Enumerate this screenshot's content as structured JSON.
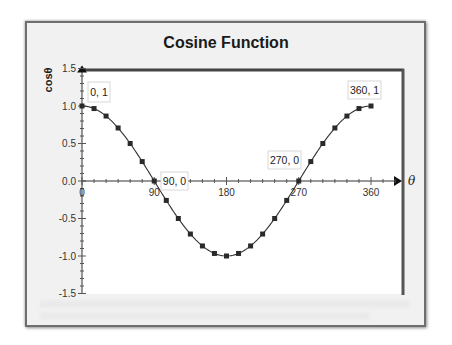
{
  "chart_data": {
    "type": "line",
    "title": "Cosine Function",
    "xlabel": "θ",
    "ylabel": "cosθ",
    "x": [
      0,
      15,
      30,
      45,
      60,
      75,
      90,
      105,
      120,
      135,
      150,
      165,
      180,
      195,
      210,
      225,
      240,
      255,
      270,
      285,
      300,
      315,
      330,
      345,
      360
    ],
    "series": [
      {
        "name": "cos θ",
        "values": [
          1.0,
          0.966,
          0.866,
          0.707,
          0.5,
          0.259,
          0.0,
          -0.259,
          -0.5,
          -0.707,
          -0.866,
          -0.966,
          -1.0,
          -0.966,
          -0.866,
          -0.707,
          -0.5,
          -0.259,
          0.0,
          0.259,
          0.5,
          0.707,
          0.866,
          0.966,
          1.0
        ],
        "marker": "square",
        "color": "#333333"
      }
    ],
    "xlim": [
      0,
      400
    ],
    "ylim": [
      -1.5,
      1.5
    ],
    "x_ticks": [
      "0",
      "90",
      "180",
      "270",
      "360"
    ],
    "y_ticks": [
      "1.5",
      "1.0",
      "0.5",
      "0.0",
      "-0.5",
      "-1.0",
      "-1.5"
    ],
    "annotations": [
      {
        "text": "0, 1",
        "x": 0,
        "y": 1
      },
      {
        "text": "90, 0",
        "x": 90,
        "y": 0
      },
      {
        "text": "270, 0",
        "x": 270,
        "y": 0
      },
      {
        "text": "360, 1",
        "x": 360,
        "y": 1
      }
    ],
    "grid": false,
    "legend": "none"
  },
  "chart": {
    "title": "Cosine Function",
    "ylabel": "cosθ",
    "xlabel": "θ",
    "colors": {
      "line": "#333333",
      "marker": "#2a2a2a",
      "frame": "#444444",
      "chart_bg": "#f1f1f1",
      "plot_bg": "#ffffff"
    }
  }
}
